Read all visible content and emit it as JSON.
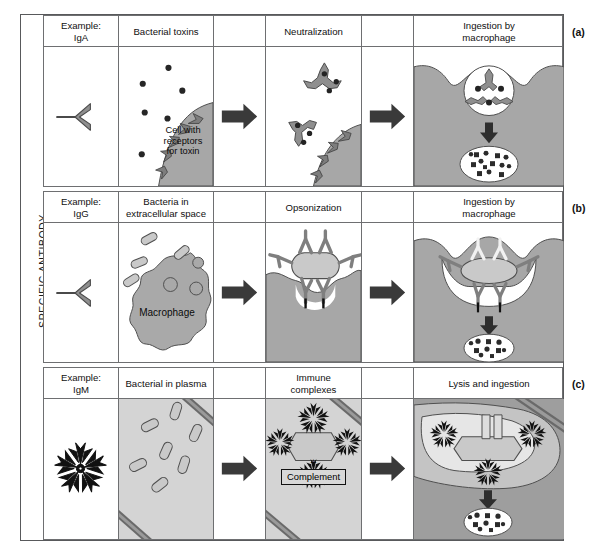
{
  "figure": {
    "axis_label": "SPECIFIC ANTIBODY",
    "colors": {
      "outline": "#58595b",
      "grid": "#6e6f71",
      "cell_gray": "#a7a7a7",
      "macrophage_gray": "#a9a9a9",
      "plasma_gray": "#cfcfcf",
      "bacterium_fill": "#c9c9c9",
      "antibody_gray": "#8f8f8f",
      "arrow_dark": "#3a3a3a",
      "toxin_dot": "#222222",
      "igm_black": "#111111"
    },
    "columns": {
      "example": "Example",
      "stage1": "Stage 1",
      "arrow1": "Arrow",
      "stage2": "Stage 2",
      "arrow2": "Arrow",
      "stage3": "Stage 3"
    }
  },
  "rows": [
    {
      "id": "a",
      "tag": "(a)",
      "isotype_label_line1": "Example:",
      "isotype_label_line2": "IgA",
      "isotype": "IgA",
      "antibody_shape": "monomer-y",
      "headers": {
        "stage1": "Bacterial toxins",
        "arrow1": "",
        "stage2": "Neutralization",
        "arrow2": "",
        "stage3_line1": "Ingestion by",
        "stage3_line2": "macrophage"
      },
      "annotations": {
        "cell_caption_line1": "Cell with",
        "cell_caption_line2": "receptors",
        "cell_caption_line3": "for toxin"
      }
    },
    {
      "id": "b",
      "tag": "(b)",
      "isotype_label_line1": "Example:",
      "isotype_label_line2": "IgG",
      "isotype": "IgG",
      "antibody_shape": "monomer-y",
      "headers": {
        "stage1_line1": "Bacteria in",
        "stage1_line2": "extracellular space",
        "arrow1": "",
        "stage2": "Opsonization",
        "arrow2": "",
        "stage3_line1": "Ingestion by",
        "stage3_line2": "macrophage"
      },
      "annotations": {
        "macrophage_caption": "Macrophage"
      }
    },
    {
      "id": "c",
      "tag": "(c)",
      "isotype_label_line1": "Example:",
      "isotype_label_line2": "IgM",
      "isotype": "IgM",
      "antibody_shape": "pentamer-star",
      "headers": {
        "stage1": "Bacterial in plasma",
        "arrow1": "",
        "stage2_line1": "Immune",
        "stage2_line2": "complexes",
        "arrow2": "",
        "stage3": "Lysis and ingestion"
      },
      "annotations": {
        "plus_sign": "+",
        "complement_box": "Complement"
      }
    }
  ]
}
